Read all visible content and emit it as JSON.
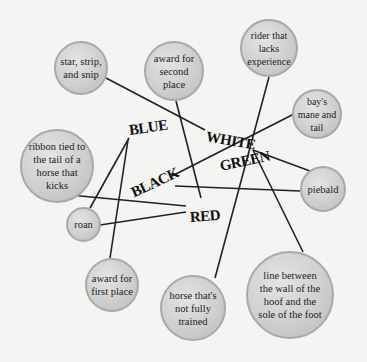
{
  "diagram": {
    "colors": {
      "background": "#f4f4f2",
      "node_fill": "#cfcfcf",
      "node_border": "#a9a9a9",
      "line": "#222222",
      "text": "#111111"
    },
    "categories": [
      {
        "id": "blue",
        "label": "BLUE"
      },
      {
        "id": "white",
        "label": "WHITE"
      },
      {
        "id": "green",
        "label": "GREEN"
      },
      {
        "id": "black",
        "label": "BLACK"
      },
      {
        "id": "red",
        "label": "RED"
      }
    ],
    "nodes": [
      {
        "id": "star",
        "text": "star, strip, and snip"
      },
      {
        "id": "award2",
        "text": "award for second place"
      },
      {
        "id": "rider",
        "text": "rider that lacks experience"
      },
      {
        "id": "bays",
        "text": "bay's mane and tail"
      },
      {
        "id": "ribbon",
        "text": "ribbon tied to the tail of a horse that kicks"
      },
      {
        "id": "roan",
        "text": "roan"
      },
      {
        "id": "award1",
        "text": "award for first place"
      },
      {
        "id": "piebald",
        "text": "piebald"
      },
      {
        "id": "hoofline",
        "text": "line between the wall of the hoof and the sole of the foot"
      },
      {
        "id": "greenhorse",
        "text": "horse that's not fully trained"
      }
    ],
    "connections": [
      {
        "from": "star",
        "to": "white"
      },
      {
        "from": "award2",
        "to": "red"
      },
      {
        "from": "rider",
        "to": "green"
      },
      {
        "from": "greenhorse",
        "to": "green"
      },
      {
        "from": "bays",
        "to": "black"
      },
      {
        "from": "piebald",
        "to": "black"
      },
      {
        "from": "piebald",
        "to": "white"
      },
      {
        "from": "hoofline",
        "to": "white"
      },
      {
        "from": "ribbon",
        "to": "red"
      },
      {
        "from": "roan",
        "to": "red"
      },
      {
        "from": "roan",
        "to": "blue"
      },
      {
        "from": "award1",
        "to": "blue"
      }
    ]
  }
}
